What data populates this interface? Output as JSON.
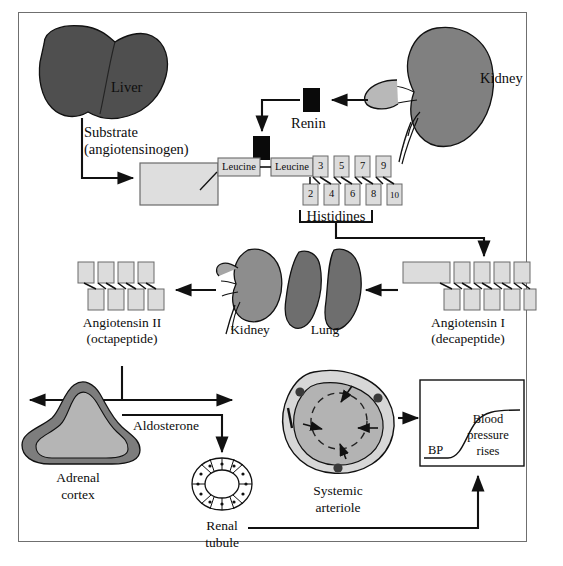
{
  "figure": {
    "background": "#ffffff",
    "frame_color": "#6f6f6f"
  },
  "palette": {
    "liver_fill": "#4f4f4f",
    "kidney_top_fill": "#808080",
    "kidney_mid_fill": "#8d8d8d",
    "lung_fill": "#6e6e6e",
    "adrenal_outer": "#7d7d7d",
    "adrenal_inner": "#b5b5b5",
    "arteriole_outer": "#d7d7d7",
    "arteriole_inner": "#b3b3b3",
    "peptide_box": "#dcdcdc",
    "substrate_box": "#dedede",
    "renin_black": "#0a0a0a",
    "stroke": "#111111"
  },
  "organs": {
    "liver_label": "Liver",
    "kidney_top_label": "Kidney",
    "kidney_mid_label": "Kidney",
    "lung_label": "Lung",
    "adrenal_label_line1": "Adrenal",
    "adrenal_label_line2": "cortex",
    "arteriole_label_line1": "Systemic",
    "arteriole_label_line2": "arteriole",
    "tubule_label_line1": "Renal",
    "tubule_label_line2": "tubule"
  },
  "flow": {
    "substrate_line1": "Substrate",
    "substrate_line2": "(angiotensinogen)",
    "renin_label": "Renin",
    "histidines_label": "Histidines",
    "aldosterone_label": "Aldosterone",
    "angiotensin_i_line1": "Angiotensin I",
    "angiotensin_i_line2": "(decapeptide)",
    "angiotensin_ii_line1": "Angiotensin II",
    "angiotensin_ii_line2": "(octapeptide)"
  },
  "peptide": {
    "leucine_1": "Leucine",
    "leucine_2": "Leucine",
    "residues_top": [
      "3",
      "5",
      "7",
      "9"
    ],
    "residues_bottom": [
      "2",
      "4",
      "6",
      "8",
      "10"
    ],
    "angiotensin_i_top_count": 4,
    "angiotensin_i_bottom_count": 5,
    "angiotensin_ii_top_count": 4,
    "angiotensin_ii_bottom_count": 4
  },
  "bp_graph": {
    "axis_label": "BP",
    "annotation_line1": "Blood",
    "annotation_line2": "pressure",
    "annotation_line3": "rises",
    "curve_shape": "sigmoid-rising"
  },
  "edge_caption": "FIGURE"
}
